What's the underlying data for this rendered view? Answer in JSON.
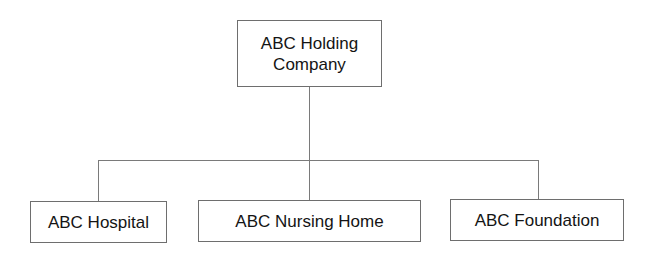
{
  "diagram": {
    "type": "org-chart",
    "root": {
      "line1": "ABC Holding",
      "line2": "Company"
    },
    "children": [
      {
        "label": "ABC Hospital"
      },
      {
        "label": "ABC Nursing Home"
      },
      {
        "label": "ABC Foundation"
      }
    ],
    "colors": {
      "border": "#6e6e6e",
      "connector": "#7a7a7a",
      "text": "#141414",
      "background": "#ffffff"
    }
  }
}
